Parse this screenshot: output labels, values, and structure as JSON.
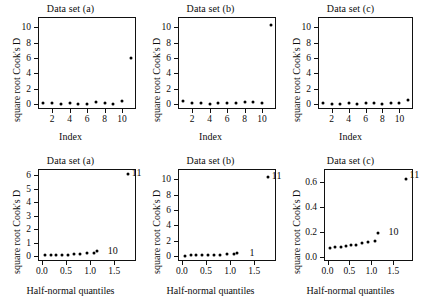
{
  "figure": {
    "point_label_a": "10",
    "point_label_b": "1",
    "point_label_c": "10",
    "corner_label": "11"
  },
  "panels": {
    "top_a": {
      "title": "Data set (a)",
      "ylabel": "square root Cook's D",
      "xlabel": "Index",
      "yticks": [
        "0",
        "2",
        "4",
        "6",
        "8",
        "10"
      ],
      "xticks": [
        "2",
        "4",
        "6",
        "8",
        "10"
      ]
    },
    "top_b": {
      "title": "Data set (b)",
      "ylabel": "square root Cook's D",
      "xlabel": "Index",
      "yticks": [
        "0",
        "2",
        "4",
        "6",
        "8",
        "10"
      ],
      "xticks": [
        "2",
        "4",
        "6",
        "8",
        "10"
      ]
    },
    "top_c": {
      "title": "Data set (c)",
      "ylabel": "square root Cook's D",
      "xlabel": "Index",
      "yticks": [
        "0",
        "2",
        "4",
        "6",
        "8",
        "10"
      ],
      "xticks": [
        "2",
        "4",
        "6",
        "8",
        "10"
      ]
    },
    "bottom_a": {
      "title": "Data set (a)",
      "ylabel": "square root Cook's D",
      "xlabel": "Half-normal quantiles",
      "yticks": [
        "0",
        "1",
        "2",
        "3",
        "4",
        "5",
        "6"
      ],
      "xticks": [
        "0.0",
        "0.5",
        "1.0",
        "1.5"
      ]
    },
    "bottom_b": {
      "title": "Data set (b)",
      "ylabel": "square root Cook's D",
      "xlabel": "Half-normal quantiles",
      "yticks": [
        "0",
        "2",
        "4",
        "6",
        "8",
        "10"
      ],
      "xticks": [
        "0.0",
        "0.5",
        "1.0",
        "1.5"
      ]
    },
    "bottom_c": {
      "title": "Data set (c)",
      "ylabel": "square root Cook's D",
      "xlabel": "Half-normal quantiles",
      "yticks": [
        "0.0",
        "0.2",
        "0.4",
        "0.6"
      ],
      "xticks": [
        "0.0",
        "0.5",
        "1.0",
        "1.5"
      ]
    }
  },
  "chart_data": [
    {
      "id": "top_a",
      "type": "scatter",
      "title": "Data set (a)",
      "xlabel": "Index",
      "ylabel": "square root Cook's D",
      "xlim": [
        0.4,
        11.6
      ],
      "ylim": [
        -0.6,
        11.3
      ],
      "xticks": [
        2,
        4,
        6,
        8,
        10
      ],
      "yticks": [
        0,
        2,
        4,
        6,
        8,
        10
      ],
      "grid": false,
      "legend": "none",
      "x": [
        1,
        2,
        3,
        4,
        5,
        6,
        7,
        8,
        9,
        10,
        11
      ],
      "y": [
        0.12,
        0.22,
        0.08,
        0.2,
        0.1,
        0.09,
        0.25,
        0.2,
        0.07,
        0.42,
        6.05
      ]
    },
    {
      "id": "top_b",
      "type": "scatter",
      "title": "Data set (b)",
      "xlabel": "Index",
      "ylabel": "square root Cook's D",
      "xlim": [
        0.4,
        11.6
      ],
      "ylim": [
        -0.6,
        11.3
      ],
      "xticks": [
        2,
        4,
        6,
        8,
        10
      ],
      "yticks": [
        0,
        2,
        4,
        6,
        8,
        10
      ],
      "grid": false,
      "legend": "none",
      "x": [
        1,
        2,
        3,
        4,
        5,
        6,
        7,
        8,
        9,
        10,
        11
      ],
      "y": [
        0.42,
        0.2,
        0.22,
        0.1,
        0.18,
        0.13,
        0.2,
        0.27,
        0.3,
        0.22,
        10.3
      ]
    },
    {
      "id": "top_c",
      "type": "scatter",
      "title": "Data set (c)",
      "xlabel": "Index",
      "ylabel": "square root Cook's D",
      "xlim": [
        0.4,
        11.6
      ],
      "ylim": [
        -0.6,
        11.3
      ],
      "xticks": [
        2,
        4,
        6,
        8,
        10
      ],
      "yticks": [
        0,
        2,
        4,
        6,
        8,
        10
      ],
      "grid": false,
      "legend": "none",
      "x": [
        1,
        2,
        3,
        4,
        5,
        6,
        7,
        8,
        9,
        10,
        11
      ],
      "y": [
        0.16,
        0.1,
        0.1,
        0.12,
        0.1,
        0.14,
        0.12,
        0.1,
        0.16,
        0.18,
        0.62
      ]
    },
    {
      "id": "bottom_a",
      "type": "scatter",
      "title": "Data set (a)",
      "xlabel": "Half-normal quantiles",
      "ylabel": "square root Cook's D",
      "xlim": [
        -0.08,
        1.95
      ],
      "ylim": [
        -0.35,
        6.45
      ],
      "xticks": [
        0.0,
        0.5,
        1.0,
        1.5
      ],
      "yticks": [
        0,
        1,
        2,
        3,
        4,
        5,
        6
      ],
      "grid": false,
      "legend": "none",
      "annotations": [
        {
          "text": "11",
          "x": 1.78,
          "y": 6.1
        },
        {
          "text": "10",
          "x": 1.28,
          "y": 0.3
        }
      ],
      "x": [
        0.06,
        0.18,
        0.3,
        0.42,
        0.54,
        0.66,
        0.79,
        0.93,
        1.09,
        1.15,
        1.78
      ],
      "y": [
        0.07,
        0.08,
        0.09,
        0.1,
        0.12,
        0.14,
        0.2,
        0.22,
        0.25,
        0.42,
        6.05
      ]
    },
    {
      "id": "bottom_b",
      "type": "scatter",
      "title": "Data set (b)",
      "xlabel": "Half-normal quantiles",
      "ylabel": "square root Cook's D",
      "xlim": [
        -0.08,
        1.95
      ],
      "ylim": [
        -0.6,
        11.3
      ],
      "xticks": [
        0.0,
        0.5,
        1.0,
        1.5
      ],
      "yticks": [
        0,
        2,
        4,
        6,
        8,
        10
      ],
      "grid": false,
      "legend": "none",
      "annotations": [
        {
          "text": "11",
          "x": 1.78,
          "y": 10.3
        },
        {
          "text": "1",
          "x": 1.32,
          "y": 0.3
        }
      ],
      "x": [
        0.06,
        0.18,
        0.3,
        0.42,
        0.54,
        0.66,
        0.79,
        0.93,
        1.09,
        1.15,
        1.78
      ],
      "y": [
        0.1,
        0.13,
        0.18,
        0.2,
        0.2,
        0.22,
        0.22,
        0.27,
        0.3,
        0.42,
        10.3
      ]
    },
    {
      "id": "bottom_c",
      "type": "scatter",
      "title": "Data set (c)",
      "xlabel": "Half-normal quantiles",
      "ylabel": "square root Cook's D",
      "xlim": [
        -0.08,
        1.95
      ],
      "ylim": [
        -0.035,
        0.7
      ],
      "xticks": [
        0.0,
        0.5,
        1.0,
        1.5
      ],
      "yticks": [
        0.0,
        0.2,
        0.4,
        0.6
      ],
      "grid": false,
      "legend": "none",
      "annotations": [
        {
          "text": "11",
          "x": 1.78,
          "y": 0.645
        },
        {
          "text": "10",
          "x": 1.3,
          "y": 0.19
        }
      ],
      "x": [
        0.06,
        0.18,
        0.3,
        0.42,
        0.54,
        0.66,
        0.79,
        0.93,
        1.09,
        1.15,
        1.78
      ],
      "y": [
        0.068,
        0.075,
        0.08,
        0.085,
        0.09,
        0.095,
        0.105,
        0.115,
        0.125,
        0.19,
        0.62
      ]
    }
  ]
}
